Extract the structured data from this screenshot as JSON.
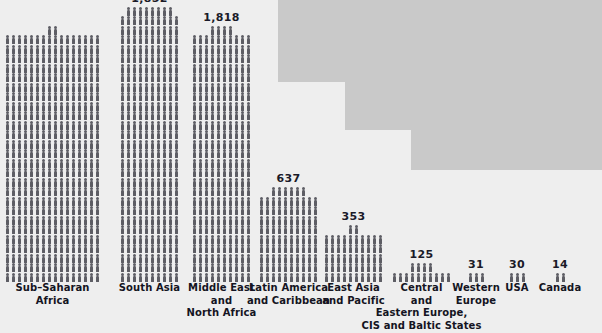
{
  "chart_data": {
    "type": "bar",
    "title": "",
    "subtitle": "",
    "xlabel": "",
    "ylabel": "",
    "grid": false,
    "legend": null,
    "pictogram": {
      "symbol": "person-figure",
      "note": "each small human figure represents a fixed number of units"
    },
    "categories": [
      "Sub-Saharan Africa",
      "South Asia",
      "Middle East and North Africa",
      "Latin America and Caribbean",
      "East Asia and Pacific",
      "Central and Eastern Europe, CIS and Baltic States",
      "Western Europe",
      "USA",
      "Canada"
    ],
    "values": [
      null,
      1852,
      1818,
      637,
      353,
      125,
      31,
      30,
      14
    ],
    "value_labels": [
      "",
      "1,852",
      "1,818",
      "637",
      "353",
      "125",
      "31",
      "30",
      "14"
    ]
  },
  "colors": {
    "background": "#eeeeee",
    "step_block": "#c9c9c9",
    "figure": "#5d5d64",
    "text": "#141422"
  },
  "columns": [
    {
      "id": "sub-saharan-africa",
      "value_label": "",
      "label_lines": [
        "Sub–Saharan",
        "Africa"
      ],
      "left": 4,
      "width": 97,
      "figures": 418,
      "per_row": 19,
      "clipped_top": true
    },
    {
      "id": "south-asia",
      "value_label": "1,852",
      "label_lines": [
        "South Asia"
      ],
      "left": 118,
      "width": 63,
      "figures": 288,
      "per_row": 12,
      "clipped_top": false
    },
    {
      "id": "middle-east-north-africa",
      "value_label": "1,818",
      "label_lines": [
        "Middle East",
        "and",
        "North Africa"
      ],
      "left": 190,
      "width": 63,
      "figures": 264,
      "per_row": 12,
      "clipped_top": false
    },
    {
      "id": "latin-america-caribbean",
      "value_label": "637",
      "label_lines": [
        "Latin America",
        "and Caribbean"
      ],
      "left": 257,
      "width": 63,
      "figures": 96,
      "per_row": 12,
      "clipped_top": false
    },
    {
      "id": "east-asia-pacific",
      "value_label": "353",
      "label_lines": [
        "East Asia",
        "and Pacific"
      ],
      "left": 322,
      "width": 63,
      "figures": 52,
      "per_row": 13,
      "clipped_top": false
    },
    {
      "id": "central-eastern-europe",
      "value_label": "125",
      "label_lines": [
        "Central",
        "and",
        "Eastern Europe,",
        "CIS and Baltic States"
      ],
      "left": 390,
      "width": 63,
      "figures": 14,
      "per_row": 12,
      "clipped_top": false
    },
    {
      "id": "western-europe",
      "value_label": "31",
      "label_lines": [
        "Western",
        "Europe"
      ],
      "left": 464,
      "width": 24,
      "figures": 3,
      "per_row": 4,
      "clipped_top": false
    },
    {
      "id": "usa",
      "value_label": "30",
      "label_lines": [
        "USA"
      ],
      "left": 505,
      "width": 24,
      "figures": 3,
      "per_row": 4,
      "clipped_top": false
    },
    {
      "id": "canada",
      "value_label": "14",
      "label_lines": [
        "Canada"
      ],
      "left": 548,
      "width": 24,
      "figures": 2,
      "per_row": 4,
      "clipped_top": false
    }
  ],
  "background_steps": [
    {
      "left": 278,
      "top": 0,
      "width": 324,
      "height": 82
    },
    {
      "left": 345,
      "top": 82,
      "width": 257,
      "height": 48
    },
    {
      "left": 411,
      "top": 130,
      "width": 191,
      "height": 40
    }
  ]
}
